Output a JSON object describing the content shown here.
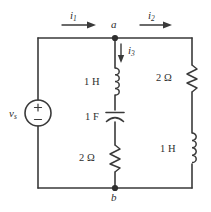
{
  "figure": {
    "type": "circuit-schematic",
    "title": "",
    "background_color": "#ffffff",
    "line_color": "#3a3a3a",
    "text_color": "#2e2e2e"
  },
  "nodes": [
    {
      "id": "a",
      "label": "a",
      "x": 115,
      "y": 38
    },
    {
      "id": "b",
      "label": "b",
      "x": 115,
      "y": 188
    }
  ],
  "currents": [
    {
      "id": "i1",
      "symbol": "i",
      "subscript": "1",
      "direction": "right",
      "branch": "top-left"
    },
    {
      "id": "i2",
      "symbol": "i",
      "subscript": "2",
      "direction": "right",
      "branch": "top-right"
    },
    {
      "id": "i3",
      "symbol": "i",
      "subscript": "3",
      "direction": "down",
      "branch": "middle"
    }
  ],
  "source": {
    "id": "vs",
    "symbol": "v",
    "subscript": "s",
    "kind": "independent-voltage-source",
    "shape": "circle",
    "polarity_top": "+",
    "polarity_bottom": "−",
    "branch": "left"
  },
  "components": [
    {
      "id": "L1",
      "kind": "inductor",
      "value": "1 H",
      "branch": "middle",
      "label_side": "left"
    },
    {
      "id": "C1",
      "kind": "capacitor",
      "value": "1 F",
      "branch": "middle",
      "label_side": "left"
    },
    {
      "id": "R1",
      "kind": "resistor",
      "value": "2 Ω",
      "branch": "middle",
      "label_side": "left"
    },
    {
      "id": "R2",
      "kind": "resistor",
      "value": "2 Ω",
      "branch": "right",
      "label_side": "left"
    },
    {
      "id": "L2",
      "kind": "inductor",
      "value": "1 H",
      "branch": "right",
      "label_side": "left"
    }
  ],
  "labels": {
    "node_a": "a",
    "node_b": "b",
    "i1": "i",
    "i1_sub": "1",
    "i2": "i",
    "i2_sub": "2",
    "i3": "i",
    "i3_sub": "3",
    "vs": "v",
    "vs_sub": "s",
    "plus": "+",
    "minus": "−",
    "L1_value": "1 H",
    "C1_value": "1 F",
    "R1_value": "2 Ω",
    "R2_value": "2 Ω",
    "L2_value": "1 H"
  }
}
